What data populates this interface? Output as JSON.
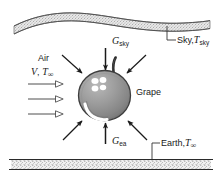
{
  "figure": {
    "width": 223,
    "height": 183,
    "background": "#ffffff"
  },
  "labels": {
    "sky": {
      "text": "Sky,",
      "symbol": "T",
      "subscript": "sky",
      "full": "Sky, T_sky"
    },
    "earth": {
      "text": "Earth,",
      "symbol": "T",
      "subscript": "∞",
      "full": "Earth, T_∞"
    },
    "air": {
      "text": "Air",
      "velocity_symbol": "V",
      "comma": ",",
      "temp_symbol": "T",
      "temp_subscript": "∞",
      "full": "Air V, T_∞"
    },
    "grape": {
      "text": "Grape"
    },
    "g_sky": {
      "symbol": "G",
      "subscript": "sky",
      "full": "G_sky"
    },
    "g_ea": {
      "symbol": "G",
      "subscript": "ea",
      "full": "G_ea"
    }
  },
  "elements": {
    "sky_band": {
      "name": "cloud-band",
      "description": "wavy stippled cloud band across top"
    },
    "ground_band": {
      "name": "ground-band",
      "description": "horizontal stippled earth band across bottom"
    },
    "grape_body": {
      "name": "grape-sphere",
      "description": "gray shaded sphere with stem"
    },
    "incoming_arrows": {
      "count": 3,
      "direction": "down"
    },
    "outgoing_arrows": {
      "count": 3,
      "direction": "up"
    },
    "air_arrows": {
      "count": 3,
      "direction": "right",
      "style": "open"
    }
  },
  "colors": {
    "stroke": "#1a1a1a",
    "grape_fill": "#9a9a9a",
    "grape_shade": "#7d7d7d",
    "grape_highlight": "#ffffff",
    "band_fill": "#d8d8d8",
    "band_stroke": "#555555",
    "text": "#1a1a1a"
  }
}
